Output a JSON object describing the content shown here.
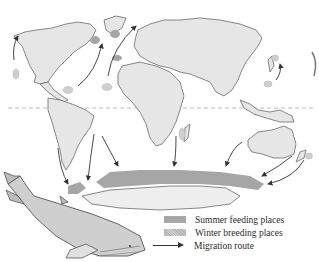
{
  "map": {
    "subject": "Humpback whale migration",
    "style": "grayscale hand-drawn world map",
    "equator_line": true,
    "colors": {
      "land": "#e6e6e6",
      "coastline": "#6b6b6b",
      "summer_feeding": "#a6a6a6",
      "winter_breeding": "#cfcfcf",
      "route_arrow": "#333333",
      "equator": "#aaaaaa"
    },
    "regions": [
      {
        "name": "North America"
      },
      {
        "name": "South America"
      },
      {
        "name": "Greenland"
      },
      {
        "name": "Europe"
      },
      {
        "name": "Africa"
      },
      {
        "name": "Asia"
      },
      {
        "name": "Australia"
      },
      {
        "name": "Antarctica"
      }
    ],
    "illustration": "humpback-whale"
  },
  "legend": {
    "items": [
      {
        "key": "summer",
        "label": "Summer feeding places"
      },
      {
        "key": "winter",
        "label": "Winter breeding places"
      },
      {
        "key": "route",
        "label": "Migration route"
      }
    ]
  }
}
